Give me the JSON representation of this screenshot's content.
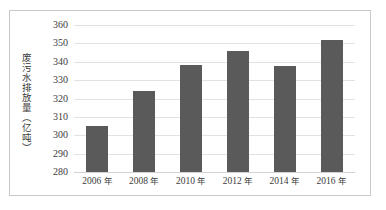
{
  "chart_data": {
    "type": "bar",
    "title": "",
    "xlabel": "",
    "ylabel": "废污水排放量（亿吨）",
    "categories": [
      "2006 年",
      "2008 年",
      "2010 年",
      "2012 年",
      "2014 年",
      "2016 年"
    ],
    "values": [
      305,
      324,
      338,
      346,
      337.5,
      352
    ],
    "ylim": [
      280,
      360
    ],
    "ytick_labels": [
      "360",
      "350",
      "340",
      "330",
      "320",
      "310",
      "300",
      "290",
      "280"
    ],
    "ytick_values": [
      360,
      350,
      340,
      330,
      320,
      310,
      300,
      290,
      280
    ],
    "grid": true,
    "legend": "none",
    "bar_color": "#5a5a5a",
    "grid_color": "#e2e2e2",
    "axis_color": "#d2d2d2",
    "frame_color": "#c9c9c9",
    "background": "#ffffff"
  }
}
